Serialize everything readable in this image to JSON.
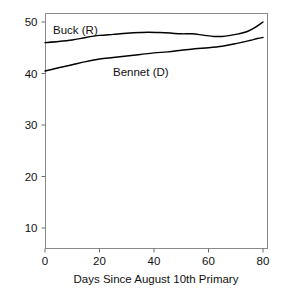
{
  "chart_data": {
    "type": "line",
    "title": "",
    "xlabel": "Days Since August 10th Primary",
    "ylabel": "",
    "xlim": [
      0,
      80
    ],
    "ylim": [
      5,
      52
    ],
    "grid": false,
    "legend_position": "inline-labels",
    "xticks": [
      0,
      20,
      40,
      60,
      80
    ],
    "yticks": [
      10,
      20,
      30,
      40,
      50
    ],
    "xtick_labels": [
      "0",
      "20",
      "40",
      "60",
      "80"
    ],
    "ytick_labels": [
      "10",
      "20",
      "30",
      "40",
      "50"
    ],
    "series": [
      {
        "name": "Buck (R)",
        "color": "#000000",
        "label_text": "Buck (R)",
        "x": [
          0,
          5,
          10,
          15,
          20,
          25,
          30,
          35,
          38,
          42,
          46,
          50,
          54,
          58,
          62,
          65,
          68,
          71,
          74,
          77,
          80
        ],
        "values": [
          46.0,
          46.2,
          46.5,
          47.0,
          47.4,
          47.6,
          47.8,
          47.95,
          48.0,
          47.95,
          47.85,
          47.7,
          47.7,
          47.45,
          47.2,
          47.2,
          47.4,
          47.7,
          48.1,
          48.9,
          50.0
        ]
      },
      {
        "name": "Bennet (D)",
        "color": "#000000",
        "label_text": "Bennet (D)",
        "x": [
          0,
          5,
          10,
          15,
          20,
          25,
          30,
          35,
          40,
          45,
          50,
          55,
          60,
          65,
          70,
          75,
          78,
          80
        ],
        "values": [
          40.5,
          41.1,
          41.7,
          42.3,
          42.8,
          43.1,
          43.4,
          43.7,
          44.0,
          44.2,
          44.5,
          44.8,
          45.0,
          45.3,
          45.8,
          46.4,
          46.8,
          47.0
        ]
      }
    ]
  },
  "annotations": {
    "buck_label": "Buck (R)",
    "bennet_label": "Bennet (D)"
  }
}
